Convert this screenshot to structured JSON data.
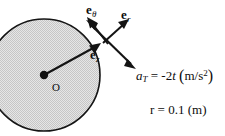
{
  "figure": {
    "colors": {
      "stroke": "#141414",
      "disk_fill": "#d9d9d9",
      "background": "#ffffff",
      "text": "#0d0d0d"
    },
    "disk": {
      "name": "shaded-circle",
      "center_label": "O",
      "center_x": 44,
      "center_y": 75,
      "radius_px": 56
    },
    "vectors": [
      {
        "id": "e_r",
        "label_e": "e",
        "label_sub": "r",
        "description": "radial unit vector, points outward up-right from rim"
      },
      {
        "id": "e_theta",
        "label_e": "e",
        "label_sub": "θ",
        "description": "tangential unit vector, points up-left along rim"
      },
      {
        "id": "e_z",
        "label_e": "e",
        "label_sub": "z",
        "description": "axial unit vector label near radius line"
      }
    ],
    "equations": {
      "tangential_acceleration": {
        "var": "a",
        "var_sub": "T",
        "equals": "=",
        "value": "-2",
        "time_var": "t",
        "open_paren": "(",
        "units": "m/s",
        "units_exp": "2",
        "close_paren": ")",
        "plain": "a_T = -2t (m/s^2)"
      },
      "radius": {
        "var": "r",
        "equals": "=",
        "value": "0.1",
        "open_paren": "(",
        "units": "m",
        "close_paren": ")",
        "plain": "r = 0.1 (m)"
      }
    }
  }
}
